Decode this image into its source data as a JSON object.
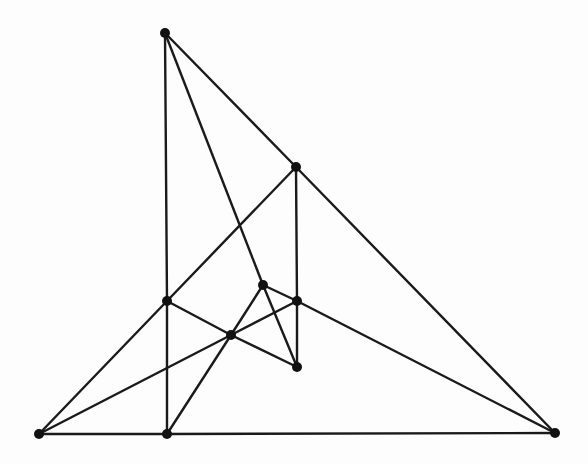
{
  "diagram": {
    "type": "graph",
    "colors": {
      "background": "#fdfdfd",
      "edge": "#1a1a1a",
      "vertex": "#111111"
    },
    "vertex_radius": 5,
    "vertices": [
      {
        "id": "A",
        "x": 165,
        "y": 33
      },
      {
        "id": "B",
        "x": 296,
        "y": 167
      },
      {
        "id": "C",
        "x": 167,
        "y": 301
      },
      {
        "id": "D",
        "x": 263,
        "y": 285
      },
      {
        "id": "E",
        "x": 297,
        "y": 301
      },
      {
        "id": "F",
        "x": 231,
        "y": 335
      },
      {
        "id": "G",
        "x": 297,
        "y": 367
      },
      {
        "id": "H",
        "x": 39,
        "y": 434
      },
      {
        "id": "I",
        "x": 167,
        "y": 434
      },
      {
        "id": "J",
        "x": 555,
        "y": 433
      }
    ],
    "edges": [
      [
        "A",
        "B"
      ],
      [
        "A",
        "C"
      ],
      [
        "A",
        "D"
      ],
      [
        "B",
        "C"
      ],
      [
        "B",
        "E"
      ],
      [
        "B",
        "J"
      ],
      [
        "C",
        "H"
      ],
      [
        "C",
        "I"
      ],
      [
        "C",
        "F"
      ],
      [
        "D",
        "F"
      ],
      [
        "D",
        "G"
      ],
      [
        "D",
        "E"
      ],
      [
        "E",
        "F"
      ],
      [
        "E",
        "G"
      ],
      [
        "E",
        "J"
      ],
      [
        "F",
        "G"
      ],
      [
        "F",
        "H"
      ],
      [
        "F",
        "I"
      ],
      [
        "H",
        "I"
      ],
      [
        "I",
        "J"
      ]
    ]
  }
}
